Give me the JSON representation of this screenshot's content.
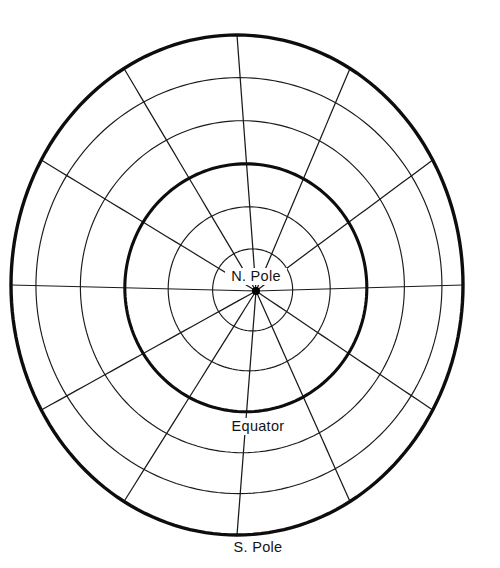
{
  "figure": {
    "background_color": "#ffffff",
    "line_color": "#1a1a1a",
    "labels": [
      {
        "id": "north-pole",
        "text": "N. Pole",
        "x": 256,
        "y": 281
      },
      {
        "id": "equator",
        "text": "Equator",
        "x": 258,
        "y": 431
      },
      {
        "id": "south-pole",
        "text": "S. Pole",
        "x": 258,
        "y": 552
      }
    ]
  },
  "chart_data": {
    "type": "line",
    "xlabel": "",
    "ylabel": "",
    "projection": "azimuthal-equidistant-polar",
    "center_point": {
      "label": "N. Pole",
      "latitude": 90,
      "cx": 256,
      "cy": 291
    },
    "ellipse_center": {
      "cx": 237,
      "cy": 285
    },
    "parallels": [
      {
        "index": 1,
        "latitude_label": "60 N",
        "latitude": 60,
        "rx": 40,
        "ry": 41,
        "emphasis": "thin"
      },
      {
        "index": 2,
        "latitude_label": "30 N",
        "latitude": 30,
        "rx": 81,
        "ry": 82,
        "emphasis": "thin"
      },
      {
        "index": 3,
        "latitude_label": "Equator",
        "latitude": 0,
        "rx": 121,
        "ry": 124,
        "emphasis": "thick"
      },
      {
        "index": 4,
        "latitude_label": "30 S",
        "latitude": -30,
        "rx": 162,
        "ry": 166,
        "emphasis": "thin"
      },
      {
        "index": 5,
        "latitude_label": "60 S",
        "latitude": -60,
        "rx": 203,
        "ry": 208,
        "emphasis": "thin"
      },
      {
        "index": 6,
        "latitude_label": "S. Pole",
        "latitude": -90,
        "rx": 226,
        "ry": 250,
        "emphasis": "thick"
      }
    ],
    "meridian_count": 12,
    "meridian_spacing_degrees": 30,
    "meridian_angles": [
      0,
      30,
      60,
      90,
      120,
      150,
      180,
      210,
      240,
      270,
      300,
      330
    ],
    "grid": true,
    "legend": "none",
    "annotations": [
      "N. Pole",
      "Equator",
      "S. Pole"
    ]
  }
}
